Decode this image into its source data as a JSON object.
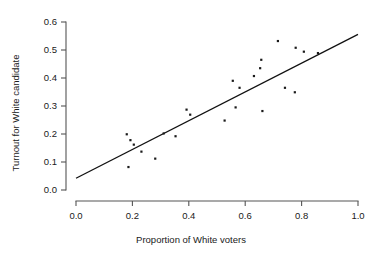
{
  "chart_data": {
    "type": "scatter",
    "title": "",
    "xlabel": "Proportion of White voters",
    "ylabel": "Turnout for White candidate",
    "xlim": [
      0.0,
      1.0
    ],
    "ylim": [
      0.0,
      0.6
    ],
    "xticks": [
      "0.0",
      "0.2",
      "0.4",
      "0.6",
      "0.8",
      "1.0"
    ],
    "xtick_values": [
      0.0,
      0.2,
      0.4,
      0.6,
      0.8,
      1.0
    ],
    "yticks": [
      "0.0",
      "0.1",
      "0.2",
      "0.3",
      "0.4",
      "0.5",
      "0.6"
    ],
    "ytick_values": [
      0.0,
      0.1,
      0.2,
      0.3,
      0.4,
      0.5,
      0.6
    ],
    "grid": false,
    "legend": false,
    "marker": "point",
    "marker_color": "#1a1a1a",
    "points": [
      {
        "x": 0.18,
        "y": 0.199
      },
      {
        "x": 0.186,
        "y": 0.082
      },
      {
        "x": 0.193,
        "y": 0.178
      },
      {
        "x": 0.205,
        "y": 0.162
      },
      {
        "x": 0.232,
        "y": 0.137
      },
      {
        "x": 0.281,
        "y": 0.112
      },
      {
        "x": 0.311,
        "y": 0.202
      },
      {
        "x": 0.353,
        "y": 0.192
      },
      {
        "x": 0.392,
        "y": 0.287
      },
      {
        "x": 0.405,
        "y": 0.269
      },
      {
        "x": 0.527,
        "y": 0.248
      },
      {
        "x": 0.556,
        "y": 0.39
      },
      {
        "x": 0.566,
        "y": 0.295
      },
      {
        "x": 0.58,
        "y": 0.365
      },
      {
        "x": 0.631,
        "y": 0.407
      },
      {
        "x": 0.653,
        "y": 0.435
      },
      {
        "x": 0.657,
        "y": 0.465
      },
      {
        "x": 0.661,
        "y": 0.282
      },
      {
        "x": 0.716,
        "y": 0.532
      },
      {
        "x": 0.741,
        "y": 0.365
      },
      {
        "x": 0.776,
        "y": 0.349
      },
      {
        "x": 0.779,
        "y": 0.508
      },
      {
        "x": 0.808,
        "y": 0.494
      },
      {
        "x": 0.858,
        "y": 0.489
      }
    ],
    "fit_line": {
      "type": "linear",
      "x_start": 0.0,
      "y_start": 0.042,
      "x_end": 1.0,
      "y_end": 0.556
    }
  },
  "axes": {
    "x_axis_name": "x-axis",
    "y_axis_name": "y-axis"
  }
}
